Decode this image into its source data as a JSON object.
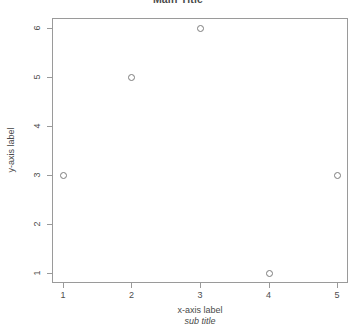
{
  "chart_data": {
    "type": "scatter",
    "title": "Main Title",
    "xlabel": "x-axis label",
    "sublabel": "sub title",
    "ylabel": "y-axis label",
    "x": [
      1,
      2,
      3,
      4,
      5
    ],
    "values": [
      3,
      5,
      6,
      1,
      3
    ],
    "points": [
      {
        "x": 1,
        "y": 3
      },
      {
        "x": 2,
        "y": 5
      },
      {
        "x": 3,
        "y": 6
      },
      {
        "x": 4,
        "y": 1
      },
      {
        "x": 5,
        "y": 3
      }
    ],
    "xticks": [
      "1",
      "2",
      "3",
      "4",
      "5"
    ],
    "yticks": [
      "1",
      "2",
      "3",
      "4",
      "5",
      "6"
    ],
    "xlim": [
      0.84,
      5.16
    ],
    "ylim": [
      0.8,
      6.2
    ],
    "grid": false,
    "legend": null,
    "marker": "open-circle",
    "marker_color": "#7c7c7c",
    "frame_color": "#9a9a9a",
    "background": "#ffffff"
  }
}
